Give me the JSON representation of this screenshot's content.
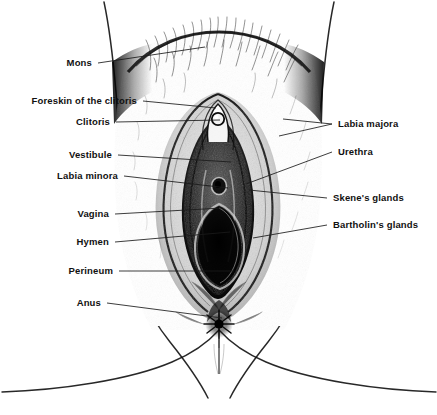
{
  "figure": {
    "background_color": "#ffffff",
    "ink_color": "#111111",
    "leader_color": "#1a1a1a"
  },
  "labels_left": [
    {
      "id": "mons",
      "text": "Mons",
      "x": 92,
      "y": 63,
      "leader_to": [
        205,
        47
      ]
    },
    {
      "id": "foreskin-of-clitoris",
      "text": "Foreskin of the clitoris",
      "x": 137,
      "y": 101,
      "leader_to": [
        216,
        108
      ]
    },
    {
      "id": "clitoris",
      "text": "Clitoris",
      "x": 110,
      "y": 122,
      "leader_to": [
        220,
        120
      ]
    },
    {
      "id": "vestibule",
      "text": "Vestibule",
      "x": 112,
      "y": 155,
      "leader_to": [
        231,
        162
      ]
    },
    {
      "id": "labia-minora",
      "text": "Labia minora",
      "x": 118,
      "y": 176,
      "leader_to": [
        228,
        188
      ]
    },
    {
      "id": "vagina",
      "text": "Vagina",
      "x": 109,
      "y": 214,
      "leader_to": [
        222,
        208
      ]
    },
    {
      "id": "hymen",
      "text": "Hymen",
      "x": 109,
      "y": 242,
      "leader_to": [
        230,
        232
      ]
    },
    {
      "id": "perineum",
      "text": "Perineum",
      "x": 113,
      "y": 271,
      "leader_to": [
        234,
        271
      ]
    },
    {
      "id": "anus",
      "text": "Anus",
      "x": 101,
      "y": 303,
      "leader_to": [
        222,
        318
      ]
    }
  ],
  "labels_right": [
    {
      "id": "labia-majora",
      "text": "Labia majora",
      "x": 338,
      "y": 124,
      "leader_to": [
        283,
        119
      ],
      "leader_to_2": [
        279,
        133
      ]
    },
    {
      "id": "urethra",
      "text": "Urethra",
      "x": 338,
      "y": 152,
      "leader_to": [
        246,
        184
      ]
    },
    {
      "id": "skenes-glands",
      "text": "Skene's glands",
      "x": 333,
      "y": 198,
      "leader_to": [
        249,
        190
      ]
    },
    {
      "id": "bartholins-glands",
      "text": "Bartholin's glands",
      "x": 333,
      "y": 225,
      "leader_to": [
        253,
        238
      ]
    }
  ]
}
